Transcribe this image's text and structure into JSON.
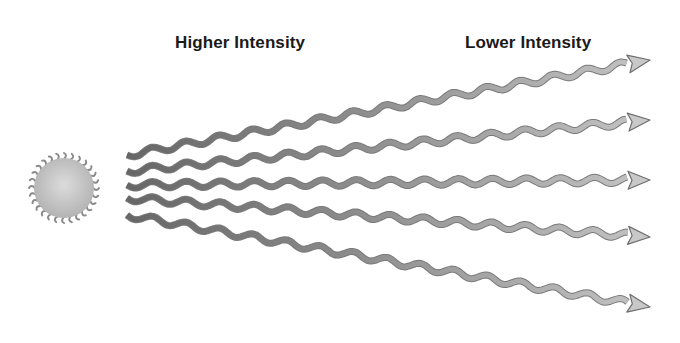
{
  "labels": {
    "high": "Higher Intensity",
    "low": "Lower Intensity"
  },
  "source": {
    "icon": "sun-icon",
    "cx": 64,
    "cy": 188,
    "r": 30,
    "color": "#c9c9c9"
  },
  "rays": [
    {
      "start": [
        127,
        155
      ],
      "end": [
        650,
        60
      ]
    },
    {
      "start": [
        127,
        171
      ],
      "end": [
        650,
        120
      ]
    },
    {
      "start": [
        127,
        185
      ],
      "end": [
        650,
        180
      ]
    },
    {
      "start": [
        127,
        198
      ],
      "end": [
        650,
        237
      ]
    },
    {
      "start": [
        127,
        215
      ],
      "end": [
        650,
        307
      ]
    }
  ],
  "colors": {
    "ray_start": "#666666",
    "ray_end": "#c4c4c4",
    "outline": "#7a7a7a",
    "text": "#1a1a1a"
  }
}
